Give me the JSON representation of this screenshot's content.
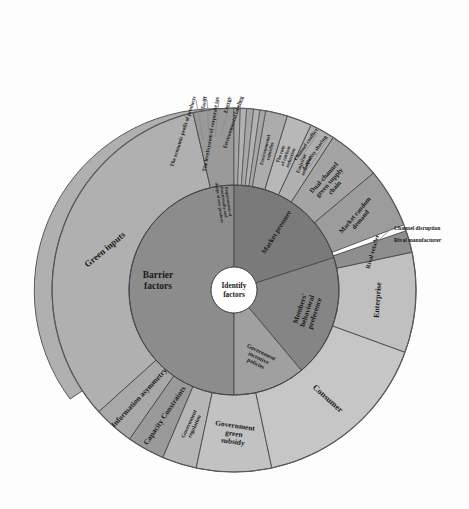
{
  "figure": {
    "type": "sunburst",
    "center_label_line1": "Identify",
    "center_label_line2": "factors",
    "background": "#fdfdfd"
  },
  "colors": {
    "ring1_barrier": "#8c8c8c",
    "ring1_market": "#7a7a7a",
    "ring1_members": "#888888",
    "ring1_gov": "#a8a8a8",
    "ring2_light": "#b3b3b3",
    "ring2_mid": "#9e9e9e",
    "ring2_pale": "#c4c4c4",
    "center_fill": "#ffffff",
    "stroke": "#4a4a4a",
    "text": "#1a1a1a"
  },
  "ring1": [
    {
      "label": "Barrier factors",
      "fill": "#8c8c8c"
    },
    {
      "label": "Market pressure",
      "fill": "#7a7a7a"
    },
    {
      "label": "Members' behavioral preference",
      "fill": "#858585"
    },
    {
      "label": "Government incentive policies",
      "fill": "#a0a0a0"
    }
  ],
  "ring2": [
    {
      "label": "Green inputs",
      "fill": "#b0b0b0"
    },
    {
      "label": "Information asymmetry",
      "fill": "#a8a8a8"
    },
    {
      "label": "Capacity Constraints",
      "fill": "#9a9a9a"
    },
    {
      "label": "Government regulation",
      "fill": "#b6b6b6"
    },
    {
      "label": "Government green subsidy",
      "fill": "#c2c2c2"
    },
    {
      "label": "Consumer",
      "fill": "#c6c6c6"
    },
    {
      "label": "Enterprise",
      "fill": "#c0c0c0"
    },
    {
      "label": "Rival retailer",
      "fill": "#8e8e8e"
    },
    {
      "label": "Market random demand",
      "fill": "#9c9c9c"
    },
    {
      "label": "Dual-channel green supply chain",
      "fill": "#a4a4a4"
    },
    {
      "label": "Emission reduction",
      "fill": "#b0b0b0"
    },
    {
      "label": "The rate of carbon reduction",
      "fill": "#b8b8b8"
    },
    {
      "label": "Environmental subsidies",
      "fill": "#acacac"
    },
    {
      "label": "Requirements of functionality and design of new products",
      "fill": "#9a9a9a"
    }
  ],
  "callouts_top": [
    {
      "label": "The economic profit of products"
    },
    {
      "label": "Tariff"
    },
    {
      "label": "The level/system of corporate tax"
    },
    {
      "label": "Energy"
    },
    {
      "label": "Environmental labeling"
    }
  ],
  "callouts_upper_right": [
    {
      "label": "Channel conflict"
    },
    {
      "label": "Capacity sharing"
    }
  ],
  "callouts_right": [
    {
      "label": "Channel disruption"
    },
    {
      "label": "Rival manufacturer"
    }
  ]
}
